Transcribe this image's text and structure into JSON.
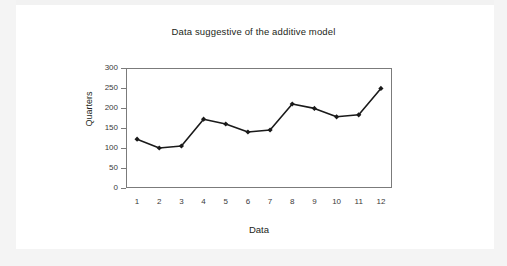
{
  "chart_data": {
    "type": "line",
    "title": "Data suggestive of the additive model",
    "xlabel": "Data",
    "ylabel": "Quarters",
    "categories": [
      "1",
      "2",
      "3",
      "4",
      "5",
      "6",
      "7",
      "8",
      "9",
      "10",
      "11",
      "12"
    ],
    "values": [
      122,
      100,
      105,
      172,
      160,
      140,
      145,
      210,
      199,
      178,
      183,
      249
    ],
    "series": [
      {
        "name": "Quarters",
        "values": [
          122,
          100,
          105,
          172,
          160,
          140,
          145,
          210,
          199,
          178,
          183,
          249
        ]
      }
    ],
    "ylim": [
      0,
      300
    ],
    "yticks": [
      "0",
      "50",
      "100",
      "150",
      "200",
      "250",
      "300"
    ],
    "xticks": [
      "1",
      "2",
      "3",
      "4",
      "5",
      "6",
      "7",
      "8",
      "9",
      "10",
      "11",
      "12"
    ],
    "grid": false,
    "legend": false,
    "marker": "diamond",
    "line_color": "#1a1a1a",
    "marker_color": "#1a1a1a",
    "plot_background": "#ffffff",
    "axis_color": "#7b7b7b"
  },
  "page": {
    "background_color": "#f2f2f2",
    "card_background": "#ffffff"
  }
}
